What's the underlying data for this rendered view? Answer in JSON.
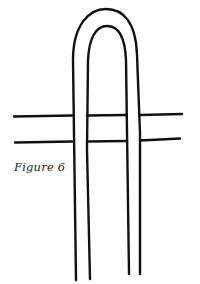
{
  "figure": {
    "caption": "Figure 6",
    "stroke_color": "#111111",
    "background": "#ffffff"
  }
}
